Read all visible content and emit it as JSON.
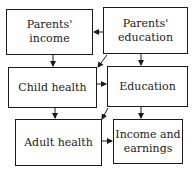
{
  "diagram": {
    "nodes": [
      {
        "id": "parents-income",
        "label": "Parents' income",
        "lines": [
          "Parents'",
          "income"
        ]
      },
      {
        "id": "parents-education",
        "label": "Parents' education",
        "lines": [
          "Parents'",
          "education"
        ]
      },
      {
        "id": "child-health",
        "label": "Child health",
        "lines": [
          "Child health"
        ]
      },
      {
        "id": "education",
        "label": "Education",
        "lines": [
          "Education"
        ]
      },
      {
        "id": "adult-health",
        "label": "Adult health",
        "lines": [
          "Adult health"
        ]
      },
      {
        "id": "income-earnings",
        "label": "Income and earnings",
        "lines": [
          "Income and",
          "earnings"
        ]
      }
    ],
    "edges": [
      {
        "from": "parents-education",
        "to": "parents-income"
      },
      {
        "from": "parents-income",
        "to": "child-health"
      },
      {
        "from": "parents-education",
        "to": "child-health"
      },
      {
        "from": "parents-education",
        "to": "education"
      },
      {
        "from": "child-health",
        "to": "education"
      },
      {
        "from": "child-health",
        "to": "adult-health"
      },
      {
        "from": "education",
        "to": "adult-health"
      },
      {
        "from": "education",
        "to": "income-earnings"
      },
      {
        "from": "adult-health",
        "to": "income-earnings"
      }
    ],
    "colors": {
      "stroke": "#1a1a1a",
      "background": "#ffffff",
      "text": "#222222"
    }
  }
}
